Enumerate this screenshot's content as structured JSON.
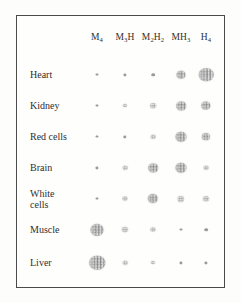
{
  "figure": {
    "frame_color": "#4a4a4a",
    "spot_color": "#8d8d8d",
    "background_color": "#fdfdfc"
  },
  "columns": [
    {
      "key": "M4",
      "base": "M",
      "sub": "4",
      "tail": "",
      "tail_sub": "",
      "label": "M4",
      "x": 96
    },
    {
      "key": "M3H",
      "base": "M",
      "sub": "3",
      "tail": "H",
      "tail_sub": "",
      "label": "M3H",
      "x": 124
    },
    {
      "key": "M2H2",
      "base": "M",
      "sub": "2",
      "tail": "H",
      "tail_sub": "2",
      "label": "M2H2",
      "x": 152
    },
    {
      "key": "MH3",
      "base": "M",
      "sub": "",
      "tail": "H",
      "tail_sub": "3",
      "label": "MH3",
      "x": 180
    },
    {
      "key": "H4",
      "base": "H",
      "sub": "4",
      "tail": "",
      "tail_sub": "",
      "label": "H4",
      "x": 205
    }
  ],
  "rows": [
    {
      "label": "Heart",
      "y": 58,
      "spots": [
        3.0,
        3.2,
        3.6,
        9.0,
        14.5
      ]
    },
    {
      "label": "Kidney",
      "y": 89,
      "spots": [
        3.0,
        4.2,
        5.8,
        9.6,
        9.4
      ]
    },
    {
      "label": "Red cells",
      "y": 120,
      "spots": [
        3.0,
        3.4,
        4.6,
        11.0,
        8.2
      ]
    },
    {
      "label": "Brain",
      "y": 151,
      "spots": [
        3.2,
        4.6,
        9.6,
        11.0,
        4.8
      ]
    },
    {
      "label": "White\ncells",
      "y": 182,
      "spots": [
        3.0,
        5.2,
        10.4,
        6.4,
        6.0
      ]
    },
    {
      "label": "Muscle",
      "y": 213,
      "spots": [
        13.0,
        6.2,
        5.2,
        3.0,
        3.6
      ]
    },
    {
      "label": "Liver",
      "y": 246,
      "spots": [
        15.5,
        4.6,
        4.2,
        3.2,
        3.2
      ]
    }
  ],
  "chart_data": {
    "type": "heatmap",
    "xlabel": "Isozyme",
    "ylabel": "Tissue",
    "grid": false,
    "legend": "none",
    "value_encoding": "spot diameter in pixels (larger spot = greater relative isozyme abundance)",
    "categories": [
      "M4",
      "M3H",
      "M2H2",
      "MH3",
      "H4"
    ],
    "category_labels": [
      "M₄",
      "M₃H",
      "M₂H₂",
      "MH₃",
      "H₄"
    ],
    "rows": [
      "Heart",
      "Kidney",
      "Red cells",
      "Brain",
      "White cells",
      "Muscle",
      "Liver"
    ],
    "series": [
      {
        "name": "Heart",
        "values": [
          3.0,
          3.2,
          3.6,
          9.0,
          14.5
        ]
      },
      {
        "name": "Kidney",
        "values": [
          3.0,
          4.2,
          5.8,
          9.6,
          9.4
        ]
      },
      {
        "name": "Red cells",
        "values": [
          3.0,
          3.4,
          4.6,
          11.0,
          8.2
        ]
      },
      {
        "name": "Brain",
        "values": [
          3.2,
          4.6,
          9.6,
          11.0,
          4.8
        ]
      },
      {
        "name": "White cells",
        "values": [
          3.0,
          5.2,
          10.4,
          6.4,
          6.0
        ]
      },
      {
        "name": "Muscle",
        "values": [
          13.0,
          6.2,
          5.2,
          3.0,
          3.6
        ]
      },
      {
        "name": "Liver",
        "values": [
          15.5,
          4.6,
          4.2,
          3.2,
          3.2
        ]
      }
    ]
  }
}
